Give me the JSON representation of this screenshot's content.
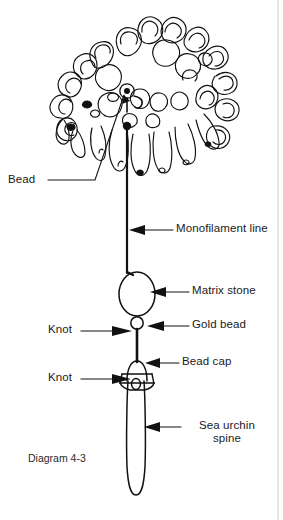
{
  "figure": {
    "title_caption": "Diagram 4-3",
    "background_color": "#ffffff",
    "ink_color": "#111111"
  },
  "labels": [
    {
      "id": "bead",
      "text": "Bead",
      "x": 8,
      "y": 176,
      "leader": "diagonal-line",
      "points_to": "bead-at-top-of-coral"
    },
    {
      "id": "monofilament-line",
      "text": "Monofilament line",
      "x": 176,
      "y": 224,
      "leader": "horizontal-arrow",
      "points_to": "vertical-nylon-line"
    },
    {
      "id": "matrix-stone",
      "text": "Matrix stone",
      "x": 192,
      "y": 285,
      "leader": "horizontal-arrow",
      "points_to": "oval-stone"
    },
    {
      "id": "gold-bead",
      "text": "Gold bead",
      "x": 192,
      "y": 320,
      "leader": "horizontal-arrow",
      "points_to": "small-round-bead"
    },
    {
      "id": "knot-upper",
      "text": "Knot",
      "x": 48,
      "y": 321,
      "leader": "horizontal-arrow",
      "points_to": "knot-below-gold-bead"
    },
    {
      "id": "bead-cap",
      "text": "Bead cap",
      "x": 182,
      "y": 355,
      "leader": "horizontal-arrow",
      "points_to": "bell-shaped-cap"
    },
    {
      "id": "knot-lower",
      "text": "Knot",
      "x": 48,
      "y": 370,
      "leader": "horizontal-arrow",
      "points_to": "knot-inside-bead-cap"
    },
    {
      "id": "sea-urchin-spine",
      "text": "Sea urchin\nspine",
      "line1": "Sea urchin",
      "line2": "spine",
      "x": 184,
      "y": 419,
      "leader": "horizontal-arrow",
      "points_to": "long-spine-body"
    }
  ],
  "components": [
    {
      "name": "coral-branch-cluster",
      "type": "organic-cluster",
      "description": "cluster of rounded coral/chrysanthemum lobes"
    },
    {
      "name": "bead",
      "type": "small-ring",
      "description": "small bead with hole at top of line"
    },
    {
      "name": "monofilament-line",
      "type": "vertical-line"
    },
    {
      "name": "matrix-stone",
      "type": "oval"
    },
    {
      "name": "gold-bead",
      "type": "small-circle"
    },
    {
      "name": "bead-cap",
      "type": "bell-cone"
    },
    {
      "name": "sea-urchin-spine",
      "type": "elongated-rounded-bar"
    }
  ]
}
